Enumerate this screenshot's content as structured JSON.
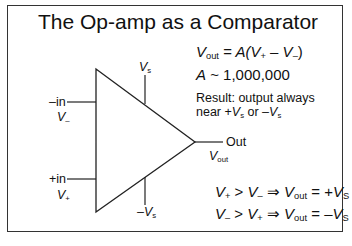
{
  "slide": {
    "title": "The Op-amp as a Comparator",
    "equations": {
      "gain_eq": {
        "lhs_sym": "V",
        "lhs_sub": "out",
        "mid": " = A(V",
        "plus_sub": "+",
        "minus": " – V",
        "minus_sub": "–",
        "close": ")"
      },
      "gain_value": {
        "sym": "A",
        "text": " ~ 1,000,000"
      },
      "result_line1": "Result: output always",
      "result_line2": {
        "prefix": "near +",
        "v": "V",
        "s": "s",
        "or": " or –",
        "v2": "V",
        "s2": "s"
      }
    },
    "diagram": {
      "vs_top": {
        "v": "V",
        "sub": "s"
      },
      "vs_bottom": {
        "prefix": "–",
        "v": "V",
        "sub": "s"
      },
      "inv_input": {
        "label": "–in",
        "v": "V",
        "sub": "–"
      },
      "noninv_input": {
        "label": "+in",
        "v": "V",
        "sub": "+"
      },
      "output": {
        "label": "Out",
        "v": "V",
        "sub": "out"
      }
    },
    "rules": [
      {
        "a": "V",
        "a_sub": "+",
        "op": " > ",
        "b": "V",
        "b_sub": "–",
        "implies": " ⇒ ",
        "c": "V",
        "c_sub": "out",
        "eq": " = +",
        "d": "V",
        "d_sub": "S"
      },
      {
        "a": "V",
        "a_sub": "–",
        "op": " > ",
        "b": "V",
        "b_sub": "+",
        "implies": " ⇒ ",
        "c": "V",
        "c_sub": "out",
        "eq": " = –",
        "d": "V",
        "d_sub": "S"
      }
    ]
  }
}
